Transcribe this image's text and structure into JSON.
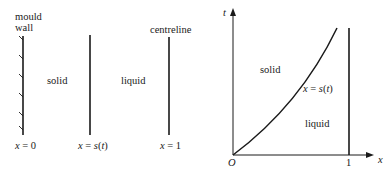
{
  "left_panel": {
    "labels": {
      "mould_wall_line1": "mould",
      "mould_wall_line2": "wall",
      "centreline": "centreline",
      "solid": "solid",
      "liquid": "liquid"
    },
    "boundary_labels": {
      "x0_var": "x",
      "x0_eq": " = 0",
      "xs_var": "x",
      "xs_eq": " = ",
      "xs_fn": "s",
      "xs_arg_open": "(",
      "xs_arg": "t",
      "xs_arg_close": ")",
      "x1_var": "x",
      "x1_eq": " = 1"
    }
  },
  "right_panel": {
    "axes": {
      "x_label": "x",
      "y_label": "t",
      "origin_label": "O",
      "x_tick_one": "1"
    },
    "regions": {
      "solid": "solid",
      "liquid": "liquid"
    },
    "curve_label": {
      "var": "x",
      "eq": " = ",
      "fn": "s",
      "open": "(",
      "arg": "t",
      "close": ")"
    }
  },
  "colors": {
    "ink": "#1a1a1a",
    "background": "#ffffff"
  }
}
